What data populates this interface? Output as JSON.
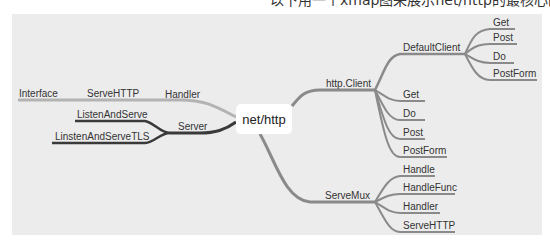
{
  "caption": "以下用一个xmap图来展示net/http的最核心的结构。",
  "mindmap": {
    "root": "net/http",
    "left": {
      "handler": {
        "label": "Handler",
        "chain": [
          "ServeHTTP",
          "Interface"
        ]
      },
      "server": {
        "label": "Server",
        "children": [
          "ListenAndServe",
          "LinstenAndServeTLS"
        ]
      }
    },
    "right": {
      "client": {
        "label": "http.Client",
        "default_client": {
          "label": "DefaultClient",
          "children": [
            "Get",
            "Post",
            "Do",
            "PostForm"
          ]
        },
        "children": [
          "Get",
          "Do",
          "Post",
          "PostForm"
        ]
      },
      "servemux": {
        "label": "ServeMux",
        "children": [
          "Handle",
          "HandleFunc",
          "Handler",
          "ServeHTTP"
        ]
      }
    }
  },
  "colors": {
    "background": "#ececec",
    "branch_gray": "#8a8a8a",
    "branch_light": "#b3b3b3",
    "branch_dark": "#3a3a3a",
    "root_fill": "#ffffff"
  }
}
